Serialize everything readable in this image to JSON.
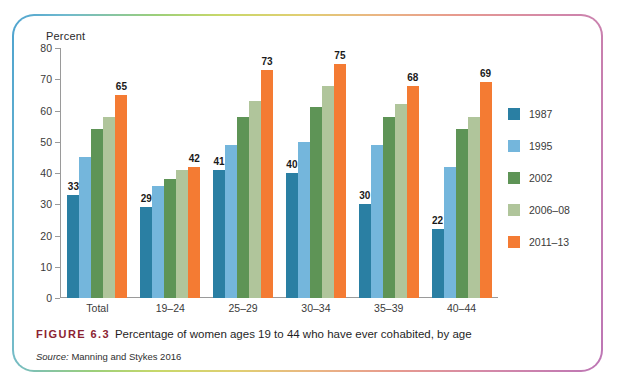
{
  "figure": {
    "number_label": "FIGURE 6.3",
    "caption": "Percentage of women ages 19 to 44 who have ever cohabited, by age",
    "source_label": "Source:",
    "source_text": "Manning and Stykes 2016",
    "figure_number_color": "#8c2332"
  },
  "chart_data": {
    "type": "bar",
    "title": "",
    "xlabel": "",
    "ylabel": "Percent",
    "ylim": [
      0,
      80
    ],
    "ytick_step": 10,
    "yticks": [
      0,
      10,
      20,
      30,
      40,
      50,
      60,
      70,
      80
    ],
    "ytick_labels": [
      "0",
      "10",
      "20",
      "30",
      "40",
      "50",
      "60",
      "70",
      "80"
    ],
    "grid": false,
    "legend_position": "right",
    "categories": [
      "Total",
      "19–24",
      "25–29",
      "30–34",
      "35–39",
      "40–44"
    ],
    "series": [
      {
        "name": "1987",
        "color": "#2a7fa3",
        "values": [
          33,
          29,
          41,
          40,
          30,
          22
        ],
        "labeled": [
          true,
          true,
          true,
          true,
          true,
          true
        ]
      },
      {
        "name": "1995",
        "color": "#74b6dc",
        "values": [
          45,
          36,
          49,
          50,
          49,
          42
        ],
        "labeled": [
          false,
          false,
          false,
          false,
          false,
          false
        ]
      },
      {
        "name": "2002",
        "color": "#5e9456",
        "values": [
          54,
          38,
          58,
          61,
          58,
          54
        ],
        "labeled": [
          false,
          false,
          false,
          false,
          false,
          false
        ]
      },
      {
        "name": "2006–08",
        "color": "#b0c59b",
        "values": [
          58,
          41,
          63,
          68,
          62,
          58
        ],
        "labeled": [
          false,
          false,
          false,
          false,
          false,
          false
        ]
      },
      {
        "name": "2011–13",
        "color": "#f47b33",
        "values": [
          65,
          42,
          73,
          75,
          68,
          69
        ],
        "labeled": [
          true,
          true,
          true,
          true,
          true,
          true
        ]
      }
    ]
  },
  "frame": {
    "gradient_start": "#4ea3cf",
    "gradient_mid": "#c8d86a",
    "gradient_end": "#bd76b5"
  }
}
